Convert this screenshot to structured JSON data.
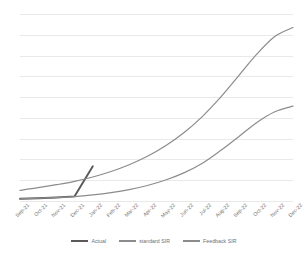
{
  "chart_data": {
    "type": "line",
    "title": "",
    "xlabel": "",
    "ylabel": "",
    "grid": true,
    "legend_position": "bottom",
    "gridline_count": 10,
    "ylim": [
      0,
      10
    ],
    "categories": [
      "Sep-21",
      "Oct-21",
      "Nov-21",
      "Dec-21",
      "Jan-22",
      "Feb-22",
      "Mar-22",
      "Apr-22",
      "May-22",
      "Jun-22",
      "Jul-22",
      "Aug-22",
      "Sep-22",
      "Oct-22",
      "Nov-22",
      "Dec-22"
    ],
    "series": [
      {
        "name": "Actual",
        "color": "#595959",
        "width": 1.9,
        "values": [
          0.17,
          0.2,
          0.24,
          0.3,
          1.9,
          null,
          null,
          null,
          null,
          null,
          null,
          null,
          null,
          null,
          null,
          null
        ]
      },
      {
        "name": "standard SIR",
        "color": "#8c8c8c",
        "width": 1.2,
        "values": [
          0.62,
          0.76,
          0.92,
          1.1,
          1.33,
          1.62,
          1.98,
          2.43,
          2.99,
          3.68,
          4.53,
          5.55,
          6.7,
          7.85,
          8.8,
          9.28
        ]
      },
      {
        "name": "Feedback SIR",
        "color": "#8c8c8c",
        "width": 1.2,
        "values": [
          0.17,
          0.2,
          0.24,
          0.29,
          0.38,
          0.5,
          0.66,
          0.88,
          1.17,
          1.55,
          2.05,
          2.72,
          3.46,
          4.22,
          4.8,
          5.1
        ]
      }
    ]
  },
  "legend": {
    "items": [
      {
        "label": "Actual",
        "color": "#595959",
        "thickness": "1.9px"
      },
      {
        "label": "standard SIR",
        "color": "#8c8c8c",
        "thickness": "1.1px"
      },
      {
        "label": "Feedback SIR",
        "color": "#8c8c8c",
        "thickness": "1.1px"
      }
    ]
  },
  "axis": {
    "tick_labels": [
      "Sep-21",
      "Oct-21",
      "Nov-21",
      "Dec-21",
      "Jan-22",
      "Feb-22",
      "Mar-22",
      "Apr-22",
      "May-22",
      "Jun-22",
      "Jul-22",
      "Aug-22",
      "Sep-22",
      "Oct-22",
      "Nov-22",
      "Dec-22"
    ]
  },
  "colors": {
    "background": "#ffffff",
    "gridline": "#e9e9e9",
    "text": "#6f6f6f",
    "series_dark": "#595959",
    "series_gray": "#8c8c8c"
  }
}
